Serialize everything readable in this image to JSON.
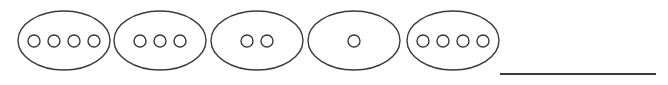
{
  "canvas": {
    "width": 668,
    "height": 85,
    "background": "#ffffff"
  },
  "style": {
    "stroke_color": "#3a3a3a",
    "ellipse_stroke_width": 1.4,
    "dot_stroke_width": 1.4,
    "line_stroke_width": 2,
    "line_color": "#3a3a3a"
  },
  "diagram": {
    "type": "grouped-counters-worksheet",
    "group_count": 5,
    "total_dots": 14,
    "answer_line_label": ""
  },
  "groups": [
    {
      "name": "group-1",
      "dot_count": 4,
      "cx": 64,
      "cy": 40.5,
      "rx": 46,
      "ry": 29.5,
      "dot_radius": 6,
      "dot_spacing": 20,
      "dots_cy": 41
    },
    {
      "name": "group-2",
      "dot_count": 3,
      "cx": 160,
      "cy": 40.5,
      "rx": 46,
      "ry": 29.5,
      "dot_radius": 6,
      "dot_spacing": 20,
      "dots_cy": 41
    },
    {
      "name": "group-3",
      "dot_count": 2,
      "cx": 257,
      "cy": 40.5,
      "rx": 46,
      "ry": 29.5,
      "dot_radius": 6,
      "dot_spacing": 20,
      "dots_cy": 41
    },
    {
      "name": "group-4",
      "dot_count": 1,
      "cx": 354,
      "cy": 40.5,
      "rx": 46,
      "ry": 29.5,
      "dot_radius": 6,
      "dot_spacing": 20,
      "dots_cy": 41
    },
    {
      "name": "group-5",
      "dot_count": 4,
      "cx": 453,
      "cy": 40.5,
      "rx": 46,
      "ry": 29.5,
      "dot_radius": 6,
      "dot_spacing": 20,
      "dots_cy": 41
    }
  ],
  "answer_line": {
    "name": "answer-line",
    "x1": 500,
    "y1": 74,
    "x2": 656,
    "y2": 74
  }
}
